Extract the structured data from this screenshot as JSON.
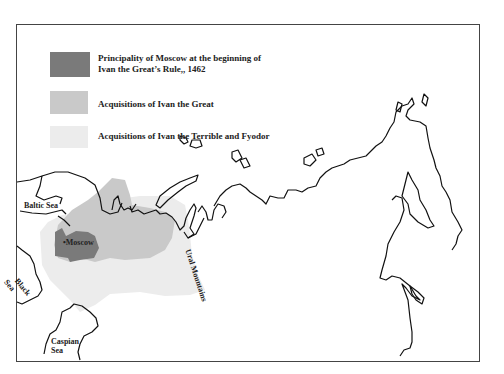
{
  "map": {
    "colors": {
      "principality": "#7a7a7a",
      "ivan_great": "#c9c9c9",
      "ivan_terrible_fyodor": "#ececec",
      "coastline": "#111111",
      "frame": "#444444"
    },
    "legend": [
      {
        "label_line1": "Principality of Moscow at the beginning of",
        "label_line2": "Ivan the Great’s Rule,, 1462",
        "color": "#7a7a7a"
      },
      {
        "label_line1": "Acquisitions of Ivan the Great",
        "color": "#c9c9c9"
      },
      {
        "label_line1": "Acquisitions of Ivan the Terrible and Fyodor",
        "color": "#ececec"
      }
    ],
    "labels": {
      "baltic": "Baltic Sea",
      "moscow": "Moscow",
      "black_1": "Black",
      "black_2": "Sea",
      "caspian_1": "Caspian",
      "caspian_2": "Sea",
      "urals": "Ural Mountains"
    }
  }
}
